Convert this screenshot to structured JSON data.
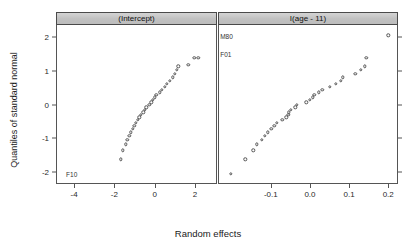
{
  "chart_data": {
    "type": "scatter",
    "title": "",
    "xlabel": "Random effects",
    "ylabel": "Quantiles of standard normal",
    "grid": false,
    "legend": "none",
    "panels": [
      {
        "strip_label": "(Intercept)",
        "xlim": [
          -4.9,
          3.1
        ],
        "ylim": [
          -2.35,
          2.35
        ],
        "xticks": [
          "-4",
          "-2",
          "0",
          "2"
        ],
        "xtick_values": [
          -4,
          -2,
          0,
          2
        ],
        "points": [
          {
            "x": -1.72,
            "y": -1.62
          },
          {
            "x": -1.63,
            "y": -1.35
          },
          {
            "x": -1.48,
            "y": -1.18
          },
          {
            "x": -1.4,
            "y": -1.05
          },
          {
            "x": -1.3,
            "y": -0.93
          },
          {
            "x": -1.22,
            "y": -0.82
          },
          {
            "x": -1.14,
            "y": -0.72
          },
          {
            "x": -1.06,
            "y": -0.63
          },
          {
            "x": -0.97,
            "y": -0.55
          },
          {
            "x": -0.9,
            "y": -0.46
          },
          {
            "x": -0.82,
            "y": -0.38
          },
          {
            "x": -0.74,
            "y": -0.31
          },
          {
            "x": -0.62,
            "y": -0.23
          },
          {
            "x": -0.54,
            "y": -0.16
          },
          {
            "x": -0.46,
            "y": -0.08
          },
          {
            "x": -0.31,
            "y": -0.01
          },
          {
            "x": -0.22,
            "y": 0.06
          },
          {
            "x": -0.13,
            "y": 0.13
          },
          {
            "x": -0.05,
            "y": 0.21
          },
          {
            "x": 0.04,
            "y": 0.28
          },
          {
            "x": 0.2,
            "y": 0.36
          },
          {
            "x": 0.32,
            "y": 0.44
          },
          {
            "x": 0.47,
            "y": 0.52
          },
          {
            "x": 0.55,
            "y": 0.61
          },
          {
            "x": 0.7,
            "y": 0.7
          },
          {
            "x": 0.84,
            "y": 0.8
          },
          {
            "x": 0.95,
            "y": 0.91
          },
          {
            "x": 1.06,
            "y": 1.03
          },
          {
            "x": 1.13,
            "y": 1.13
          },
          {
            "x": 1.62,
            "y": 1.17
          },
          {
            "x": 1.93,
            "y": 1.38
          },
          {
            "x": 2.12,
            "y": 1.38
          }
        ],
        "annotations": [
          {
            "text": "F10",
            "x": -4.45,
            "y": -2.05,
            "align": "left"
          }
        ]
      },
      {
        "strip_label": "I(age - 11)",
        "xlim": [
          -0.235,
          0.225
        ],
        "ylim": [
          -2.35,
          2.35
        ],
        "xticks": [
          "-0.1",
          "0.0",
          "0.1",
          "0.2"
        ],
        "xtick_values": [
          -0.1,
          0.0,
          0.1,
          0.2
        ],
        "points": [
          {
            "x": -0.205,
            "y": -2.05
          },
          {
            "x": -0.168,
            "y": -1.62
          },
          {
            "x": -0.147,
            "y": -1.35
          },
          {
            "x": -0.139,
            "y": -1.18
          },
          {
            "x": -0.125,
            "y": -1.05
          },
          {
            "x": -0.118,
            "y": -0.93
          },
          {
            "x": -0.11,
            "y": -0.82
          },
          {
            "x": -0.101,
            "y": -0.72
          },
          {
            "x": -0.094,
            "y": -0.63
          },
          {
            "x": -0.088,
            "y": -0.55
          },
          {
            "x": -0.073,
            "y": -0.46
          },
          {
            "x": -0.063,
            "y": -0.38
          },
          {
            "x": -0.058,
            "y": -0.31
          },
          {
            "x": -0.056,
            "y": -0.23
          },
          {
            "x": -0.052,
            "y": -0.16
          },
          {
            "x": -0.04,
            "y": -0.08
          },
          {
            "x": -0.036,
            "y": -0.01
          },
          {
            "x": -0.012,
            "y": 0.06
          },
          {
            "x": -0.003,
            "y": 0.13
          },
          {
            "x": 0.004,
            "y": 0.21
          },
          {
            "x": 0.009,
            "y": 0.28
          },
          {
            "x": 0.02,
            "y": 0.36
          },
          {
            "x": 0.029,
            "y": 0.44
          },
          {
            "x": 0.048,
            "y": 0.52
          },
          {
            "x": 0.063,
            "y": 0.61
          },
          {
            "x": 0.076,
            "y": 0.7
          },
          {
            "x": 0.082,
            "y": 0.8
          },
          {
            "x": 0.113,
            "y": 0.91
          },
          {
            "x": 0.127,
            "y": 1.03
          },
          {
            "x": 0.138,
            "y": 1.13
          },
          {
            "x": 0.141,
            "y": 1.38
          },
          {
            "x": 0.198,
            "y": 2.05
          }
        ],
        "annotations": [
          {
            "text": "M80",
            "x": -0.232,
            "y": 2.02,
            "align": "left"
          },
          {
            "text": "F01",
            "x": -0.232,
            "y": 1.5,
            "align": "left"
          }
        ]
      }
    ],
    "yticks": [
      "2",
      "1",
      "0",
      "-1",
      "-2"
    ],
    "ytick_values": [
      2,
      1,
      0,
      -1,
      -2
    ]
  },
  "style": {
    "point_stroke": "#555555",
    "strip_fill": "#c8c8c8",
    "axis_color": "#555555",
    "text_color": "#1a1a1a"
  }
}
